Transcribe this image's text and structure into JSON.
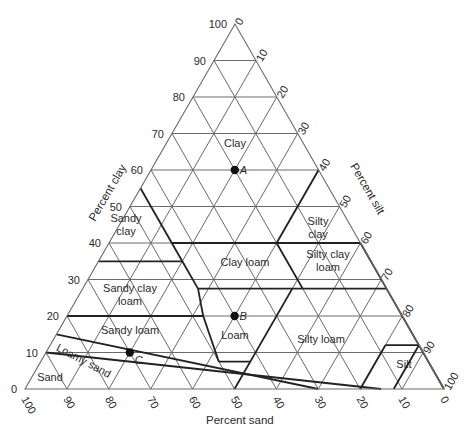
{
  "diagram": {
    "type": "ternary-soil-texture-triangle",
    "geometry": {
      "apex": [
        235,
        24
      ],
      "left": [
        25,
        389
      ],
      "right": [
        444,
        389
      ]
    },
    "axes": {
      "clay": {
        "label": "Percent clay",
        "ticks": [
          "0",
          "10",
          "20",
          "30",
          "40",
          "50",
          "60",
          "70",
          "80",
          "90",
          "100"
        ]
      },
      "silt": {
        "label": "Percent silt",
        "ticks": [
          "0",
          "10",
          "20",
          "30",
          "40",
          "50",
          "60",
          "70",
          "80",
          "90",
          "100"
        ]
      },
      "sand": {
        "label": "Percent sand",
        "ticks": [
          "100",
          "90",
          "80",
          "70",
          "60",
          "50",
          "40",
          "30",
          "20",
          "10",
          "0"
        ]
      }
    },
    "regions": [
      {
        "name": "Clay",
        "lines": [
          "Clay"
        ],
        "pos": [
          235,
          147
        ]
      },
      {
        "name": "Sandy clay",
        "lines": [
          "Sandy",
          "clay"
        ],
        "pos": [
          126,
          222
        ]
      },
      {
        "name": "Silty clay",
        "lines": [
          "Silty",
          "clay"
        ],
        "pos": [
          318,
          225
        ]
      },
      {
        "name": "Clay loam",
        "lines": [
          "Clay loam"
        ],
        "pos": [
          245,
          266
        ]
      },
      {
        "name": "Silty clay loam",
        "lines": [
          "Silty clay",
          "loam"
        ],
        "pos": [
          328,
          258
        ]
      },
      {
        "name": "Sandy clay loam",
        "lines": [
          "Sandy clay",
          "loam"
        ],
        "pos": [
          130,
          292
        ]
      },
      {
        "name": "Sandy loam",
        "lines": [
          "Sandy loam"
        ],
        "pos": [
          130,
          334
        ]
      },
      {
        "name": "Loam",
        "lines": [
          "Loam"
        ],
        "pos": [
          235,
          339
        ]
      },
      {
        "name": "Silty loam",
        "lines": [
          "Silty loam"
        ],
        "pos": [
          321,
          343
        ]
      },
      {
        "name": "Silt",
        "lines": [
          "Silt"
        ],
        "pos": [
          404,
          368
        ]
      },
      {
        "name": "Sand",
        "lines": [
          "Sand"
        ],
        "pos": [
          50,
          381
        ]
      },
      {
        "name": "Loamy sand",
        "lines": [
          "Loamy sand"
        ],
        "pos": [
          82,
          364
        ],
        "rotate": 28
      }
    ],
    "boundaries": [
      [
        [
          55,
          0
        ],
        [
          40,
          15
        ]
      ],
      [
        [
          40,
          15
        ],
        [
          40,
          40
        ]
      ],
      [
        [
          40,
          40
        ],
        [
          60,
          40
        ]
      ],
      [
        [
          40,
          40
        ],
        [
          40,
          60
        ]
      ],
      [
        [
          35,
          0
        ],
        [
          35,
          20
        ]
      ],
      [
        [
          35,
          20
        ],
        [
          40,
          15
        ]
      ],
      [
        [
          35,
          20
        ],
        [
          27.5,
          27.5
        ]
      ],
      [
        [
          27.5,
          27.5
        ],
        [
          27.5,
          52.5
        ]
      ],
      [
        [
          27.5,
          52.5
        ],
        [
          27.5,
          72.5
        ]
      ],
      [
        [
          27.5,
          52.5
        ],
        [
          40,
          40
        ]
      ],
      [
        [
          27.5,
          72.5
        ],
        [
          40,
          60
        ]
      ],
      [
        [
          27.5,
          27.5
        ],
        [
          20,
          32.5
        ]
      ],
      [
        [
          20,
          0
        ],
        [
          20,
          32.5
        ]
      ],
      [
        [
          20,
          32.5
        ],
        [
          7.5,
          42.5
        ]
      ],
      [
        [
          7.5,
          42.5
        ],
        [
          7.5,
          50
        ]
      ],
      [
        [
          7.5,
          50
        ],
        [
          0,
          50
        ]
      ],
      [
        [
          7.5,
          50
        ],
        [
          27.5,
          50
        ]
      ],
      [
        [
          12,
          80
        ],
        [
          0,
          80
        ]
      ],
      [
        [
          12,
          80
        ],
        [
          12,
          88
        ]
      ],
      [
        [
          12,
          88
        ],
        [
          0,
          88
        ]
      ],
      [
        [
          15,
          0
        ],
        [
          0,
          70
        ]
      ],
      [
        [
          10,
          0
        ],
        [
          0,
          85
        ]
      ],
      [
        [
          27.5,
          72.5
        ],
        [
          0,
          100
        ]
      ]
    ],
    "points": [
      {
        "label": "A",
        "clay": 60,
        "silt": 20,
        "sand": 20
      },
      {
        "label": "B",
        "clay": 20,
        "silt": 40,
        "sand": 40
      },
      {
        "label": "C",
        "clay": 10,
        "silt": 20,
        "sand": 70
      }
    ],
    "colors": {
      "grid": "#6a6a6a",
      "boundary": "#222222",
      "text": "#2a2a2a",
      "point": "#111111"
    }
  }
}
